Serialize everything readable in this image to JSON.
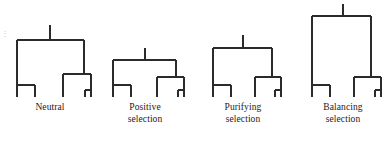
{
  "figure": {
    "background_color": "#ffffff",
    "line_color": "#2b2b2b",
    "text_color": "#222222"
  },
  "trees": [
    {
      "id": "neutral",
      "label": "Neutral",
      "label_lines": "Neutral",
      "root_depth_px": 40,
      "leaf_count": 4,
      "center_x": 50
    },
    {
      "id": "positive-selection",
      "label": "Positive selection",
      "label_lines": "Positive\nselection",
      "root_depth_px": 60,
      "leaf_count": 4,
      "center_x": 145
    },
    {
      "id": "purifying-selection",
      "label": "Purifying selection",
      "label_lines": "Purifying\nselection",
      "root_depth_px": 48,
      "leaf_count": 4,
      "center_x": 243
    },
    {
      "id": "balancing-selection",
      "label": "Balancing selection",
      "label_lines": "Balancing\nselection",
      "root_depth_px": 16,
      "leaf_count": 4,
      "center_x": 343
    }
  ],
  "edge_mark": {
    "text": "⋮"
  }
}
